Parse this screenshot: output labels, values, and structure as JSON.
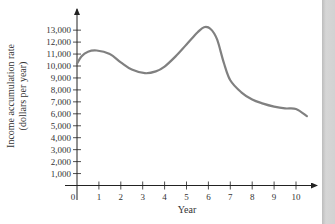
{
  "chart_data": {
    "type": "line",
    "title": "",
    "xlabel": "Year",
    "ylabel": "Income accumulation rate (dollars per year)",
    "ylabel_lines": [
      "Income accumulation rate",
      "(dollars per year)"
    ],
    "x_ticks": [
      "0",
      "1",
      "2",
      "3",
      "4",
      "5",
      "6",
      "7",
      "8",
      "9",
      "10"
    ],
    "y_ticks": [
      "1,000",
      "2,000",
      "3,000",
      "4,000",
      "5,000",
      "6,000",
      "7,000",
      "8,000",
      "9,000",
      "10,000",
      "11,000",
      "12,000",
      "13,000"
    ],
    "xlim": [
      0,
      11
    ],
    "ylim": [
      0,
      14000
    ],
    "grid": false,
    "legend": null,
    "series": [
      {
        "name": "Income accumulation rate",
        "color": "#808080",
        "x": [
          0,
          0.2,
          0.5,
          0.9,
          1.5,
          2.0,
          2.5,
          3.1,
          3.6,
          4.0,
          4.5,
          5.0,
          5.5,
          5.8,
          6.1,
          6.4,
          6.7,
          7.0,
          7.5,
          8.0,
          8.5,
          9.0,
          9.5,
          10.0,
          10.5
        ],
        "values": [
          10200,
          10800,
          11200,
          11300,
          11000,
          10300,
          9700,
          9400,
          9550,
          9950,
          10800,
          11800,
          12800,
          13250,
          13100,
          12200,
          10300,
          8800,
          7800,
          7200,
          6850,
          6600,
          6450,
          6400,
          5800
        ]
      }
    ]
  }
}
